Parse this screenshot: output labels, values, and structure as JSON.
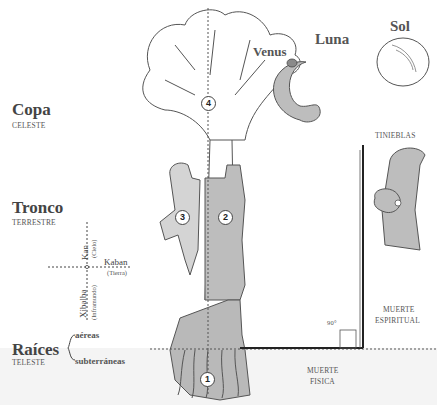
{
  "levels": {
    "copa": {
      "title": "Copa",
      "sub": "CELESTE"
    },
    "tronco": {
      "title": "Tronco",
      "sub": "TERRESTRE"
    },
    "raices": {
      "title": "Raíces",
      "sub": "TELESTE",
      "types": [
        "aéreas",
        "subterráneas"
      ]
    }
  },
  "axes": {
    "kan": {
      "label": "Kan",
      "sub": "(Cielo)"
    },
    "kaban": {
      "label": "Kaban",
      "sub": "(Tierra)"
    },
    "xibalba": {
      "label": "Xibalba",
      "sub": "(Inframundo)"
    }
  },
  "sky": {
    "venus": "Venus",
    "luna": "Luna",
    "sol": "Sol"
  },
  "numbers": [
    "1",
    "2",
    "3",
    "4"
  ],
  "right": {
    "tinieblas": "TINIEBLAS",
    "muerte_espiritual": [
      "MUERTE",
      "ESPIRITUAL"
    ],
    "angle": "90°",
    "muerte_fisica": [
      "MUERTE",
      "FISICA"
    ]
  },
  "colors": {
    "gray_fill": "#b9b9b9",
    "line": "#444444",
    "background": "#ffffff"
  }
}
